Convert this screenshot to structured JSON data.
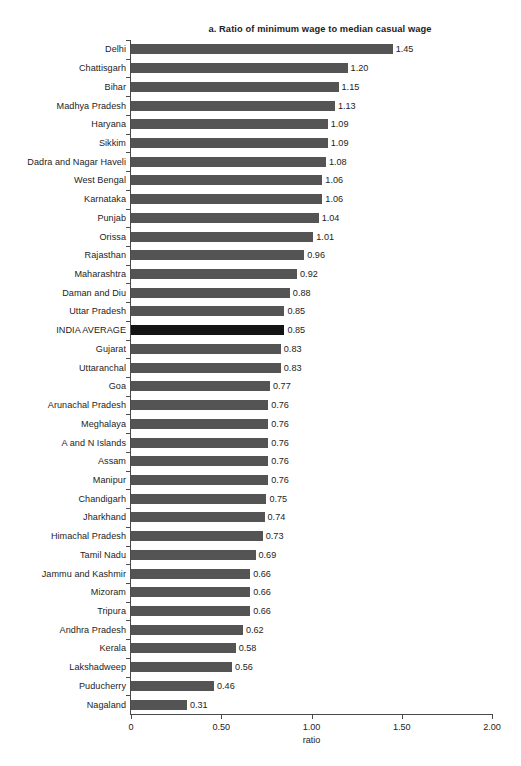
{
  "chart_data": {
    "type": "bar",
    "orientation": "horizontal",
    "title": "a. Ratio of minimum wage to median casual wage",
    "xlabel": "ratio",
    "ylabel": "",
    "xlim": [
      0,
      2.0
    ],
    "grid": false,
    "legend": null,
    "xticks": [
      {
        "value": 0,
        "label": "0"
      },
      {
        "value": 0.5,
        "label": "0.50"
      },
      {
        "value": 1.0,
        "label": "1.00"
      },
      {
        "value": 1.5,
        "label": "1.50"
      },
      {
        "value": 2.0,
        "label": "2.00"
      }
    ],
    "bar_color": "#545454",
    "highlight_color": "#141414",
    "highlight_category": "INDIA AVERAGE",
    "categories": [
      "Delhi",
      "Chattisgarh",
      "Bihar",
      "Madhya Pradesh",
      "Haryana",
      "Sikkim",
      "Dadra and Nagar Haveli",
      "West Bengal",
      "Karnataka",
      "Punjab",
      "Orissa",
      "Rajasthan",
      "Maharashtra",
      "Daman and Diu",
      "Uttar Pradesh",
      "INDIA AVERAGE",
      "Gujarat",
      "Uttaranchal",
      "Goa",
      "Arunachal Pradesh",
      "Meghalaya",
      "A and N Islands",
      "Assam",
      "Manipur",
      "Chandigarh",
      "Jharkhand",
      "Himachal Pradesh",
      "Tamil Nadu",
      "Jammu and Kashmir",
      "Mizoram",
      "Tripura",
      "Andhra Pradesh",
      "Kerala",
      "Lakshadweep",
      "Puducherry",
      "Nagaland"
    ],
    "values": [
      1.45,
      1.2,
      1.15,
      1.13,
      1.09,
      1.09,
      1.08,
      1.06,
      1.06,
      1.04,
      1.01,
      0.96,
      0.92,
      0.88,
      0.85,
      0.85,
      0.83,
      0.83,
      0.77,
      0.76,
      0.76,
      0.76,
      0.76,
      0.76,
      0.75,
      0.74,
      0.73,
      0.69,
      0.66,
      0.66,
      0.66,
      0.62,
      0.58,
      0.56,
      0.46,
      0.31
    ],
    "value_labels": [
      "1.45",
      "1.20",
      "1.15",
      "1.13",
      "1.09",
      "1.09",
      "1.08",
      "1.06",
      "1.06",
      "1.04",
      "1.01",
      "0.96",
      "0.92",
      "0.88",
      "0.85",
      "0.85",
      "0.83",
      "0.83",
      "0.77",
      "0.76",
      "0.76",
      "0.76",
      "0.76",
      "0.76",
      "0.75",
      "0.74",
      "0.73",
      "0.69",
      "0.66",
      "0.66",
      "0.66",
      "0.62",
      "0.58",
      "0.56",
      "0.46",
      "0.31"
    ]
  }
}
